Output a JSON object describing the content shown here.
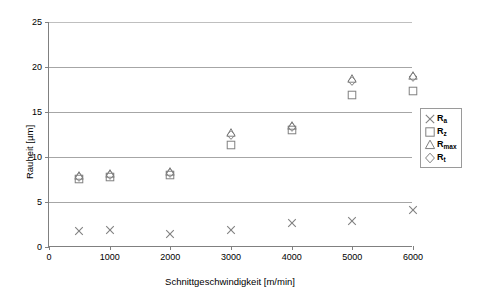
{
  "chart_data": {
    "type": "scatter",
    "title": "",
    "xlabel": "Schnittgeschwindigkeit [m/min]",
    "ylabel": "Rauheit [µm]",
    "xlim": [
      0,
      6000
    ],
    "ylim": [
      0,
      25
    ],
    "xticks": [
      0,
      1000,
      2000,
      3000,
      4000,
      5000,
      6000
    ],
    "yticks": [
      0,
      5,
      10,
      15,
      20,
      25
    ],
    "xtick_labels": [
      "0",
      "1000",
      "2000",
      "3000",
      "4000",
      "5000",
      "6000"
    ],
    "ytick_labels": [
      "0",
      "5",
      "10",
      "15",
      "20",
      "25"
    ],
    "grid": "horizontal",
    "legend_position": "right-outside",
    "x": [
      500,
      1000,
      2000,
      3000,
      4000,
      5000,
      6000
    ],
    "series": [
      {
        "name": "Ra",
        "label_base": "R",
        "label_sub": "a",
        "marker": "cross",
        "color": "#808080",
        "values": [
          1.8,
          1.9,
          1.5,
          1.9,
          2.7,
          2.9,
          4.1
        ]
      },
      {
        "name": "Rz",
        "label_base": "R",
        "label_sub": "z",
        "marker": "square",
        "color": "#808080",
        "values": [
          7.6,
          7.8,
          8.0,
          11.3,
          13.0,
          16.9,
          17.3
        ]
      },
      {
        "name": "Rmax",
        "label_base": "R",
        "label_sub": "max",
        "marker": "triangle",
        "color": "#808080",
        "values": [
          7.9,
          8.1,
          8.3,
          12.7,
          13.5,
          18.7,
          19.0
        ]
      },
      {
        "name": "Rt",
        "label_base": "R",
        "label_sub": "t",
        "marker": "diamond",
        "color": "#808080",
        "values": [
          7.8,
          8.0,
          8.2,
          12.5,
          13.3,
          18.5,
          18.9
        ]
      }
    ]
  },
  "legend": {
    "entries": [
      {
        "base": "R",
        "sub": "a",
        "marker": "cross"
      },
      {
        "base": "R",
        "sub": "z",
        "marker": "square"
      },
      {
        "base": "R",
        "sub": "max",
        "marker": "triangle"
      },
      {
        "base": "R",
        "sub": "t",
        "marker": "diamond"
      }
    ]
  },
  "colors": {
    "marker": "#808080",
    "axis": "#808080",
    "grid": "#a6a6a6",
    "legend_border": "#9a9a9a",
    "background": "#ffffff"
  }
}
